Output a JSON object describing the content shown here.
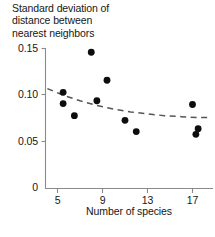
{
  "chart_data": {
    "type": "scatter",
    "title": "Standard deviation of\ndistance between\nnearest neighbors",
    "xlabel": "Number of species",
    "ylabel": "",
    "xlim": [
      4.0,
      18.5
    ],
    "ylim": [
      0,
      0.15
    ],
    "grid": false,
    "legend": null,
    "x_ticks": [
      5,
      9,
      13,
      17
    ],
    "x_tick_labels": [
      "5",
      "9",
      "13",
      "17"
    ],
    "y_ticks": [
      0,
      0.05,
      0.1,
      0.15
    ],
    "y_tick_labels": [
      "0",
      "0.05",
      "0.10",
      "0.15"
    ],
    "x": [
      5.5,
      5.5,
      6.5,
      8.0,
      8.5,
      9.4,
      11.0,
      12.0,
      17.0,
      17.3,
      17.5
    ],
    "y": [
      0.103,
      0.091,
      0.078,
      0.146,
      0.094,
      0.116,
      0.073,
      0.061,
      0.09,
      0.058,
      0.064
    ],
    "points": [
      {
        "x": 5.5,
        "y": 0.103
      },
      {
        "x": 5.5,
        "y": 0.091
      },
      {
        "x": 6.5,
        "y": 0.078
      },
      {
        "x": 8.0,
        "y": 0.146
      },
      {
        "x": 8.5,
        "y": 0.094
      },
      {
        "x": 9.4,
        "y": 0.116
      },
      {
        "x": 11.0,
        "y": 0.073
      },
      {
        "x": 12.0,
        "y": 0.061
      },
      {
        "x": 17.0,
        "y": 0.09
      },
      {
        "x": 17.3,
        "y": 0.058
      },
      {
        "x": 17.5,
        "y": 0.064
      }
    ],
    "trend_line": {
      "name": "fitted curve",
      "style": "dashed",
      "x": [
        4.1,
        5.5,
        7.0,
        8.5,
        10.0,
        11.5,
        13.0,
        14.5,
        16.0,
        17.5,
        18.4
      ],
      "y": [
        0.107,
        0.1,
        0.094,
        0.089,
        0.085,
        0.082,
        0.08,
        0.078,
        0.077,
        0.076,
        0.076
      ]
    },
    "marker_color": "#0d0d0d",
    "axis_color": "#7d7d7d",
    "trend_color": "#555555",
    "background": "#ffffff"
  }
}
